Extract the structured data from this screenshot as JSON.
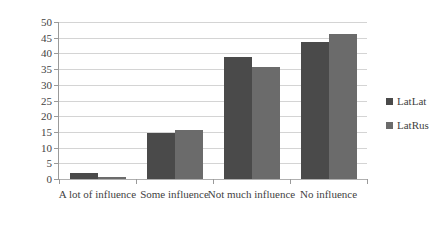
{
  "chart_data": {
    "type": "bar",
    "title": "",
    "subtitle": "",
    "xlabel": "",
    "ylabel": "",
    "ylim": [
      0,
      50
    ],
    "ytick_step": 5,
    "yticks": [
      "0",
      "5",
      "10",
      "15",
      "20",
      "25",
      "30",
      "35",
      "40",
      "45",
      "50"
    ],
    "grid": true,
    "grid_axis": "y",
    "legend_position": "right",
    "categories": [
      "A lot of influence",
      "Some influence",
      "Not much influence",
      "No influence"
    ],
    "series": [
      {
        "name": "LatLat",
        "color": "#4a4a4a",
        "values": [
          2.0,
          14.8,
          38.8,
          43.7
        ]
      },
      {
        "name": "LatRus",
        "color": "#6b6b6b",
        "values": [
          0.7,
          15.5,
          35.6,
          46.3
        ]
      }
    ]
  },
  "legend": {
    "items": [
      {
        "label": "LatLat",
        "color": "#4a4a4a"
      },
      {
        "label": "LatRus",
        "color": "#6b6b6b"
      }
    ]
  },
  "colors": {
    "background": "#ffffff",
    "gridline": "#d4d4d4",
    "axis": "#9a9a9a",
    "text": "#3f3f3f",
    "series_1": "#4a4a4a",
    "series_2": "#6b6b6b"
  }
}
